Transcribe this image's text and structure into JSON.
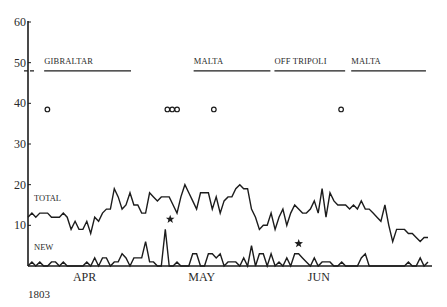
{
  "chart_data": {
    "type": "line",
    "title": "",
    "xlabel": "",
    "ylabel": "",
    "year_label": "1803",
    "ylim": [
      0,
      60
    ],
    "yticks": [
      10,
      20,
      30,
      40,
      50,
      60
    ],
    "grid": false,
    "months": [
      {
        "label": "APR",
        "x_frac": 0.14
      },
      {
        "label": "MAY",
        "x_frac": 0.43
      },
      {
        "label": "JUN",
        "x_frac": 0.72
      }
    ],
    "locations": [
      {
        "label": "GIBRALTAR",
        "start_frac": 0.04,
        "end_frac": 0.255,
        "y": 48
      },
      {
        "label": "MALTA",
        "start_frac": 0.41,
        "end_frac": 0.6,
        "y": 48
      },
      {
        "label": "OFF  TRIPOLI",
        "start_frac": 0.61,
        "end_frac": 0.785,
        "y": 48
      },
      {
        "label": "MALTA",
        "start_frac": 0.8,
        "end_frac": 0.985,
        "y": 48
      }
    ],
    "dashed_marker": {
      "y": 48
    },
    "circle_events": [
      {
        "x_frac": 0.048,
        "y": 38.5
      },
      {
        "x_frac": 0.345,
        "y": 38.5
      },
      {
        "x_frac": 0.357,
        "y": 38.5
      },
      {
        "x_frac": 0.369,
        "y": 38.5
      },
      {
        "x_frac": 0.46,
        "y": 38.5
      },
      {
        "x_frac": 0.775,
        "y": 38.5
      }
    ],
    "star_events": [
      {
        "x_frac": 0.352,
        "y": 11.5
      },
      {
        "x_frac": 0.67,
        "y": 5.5
      }
    ],
    "series": [
      {
        "name": "TOTAL",
        "label_y": 16,
        "values": [
          12,
          13,
          12,
          13,
          13,
          13,
          12,
          12,
          12,
          13,
          12,
          9,
          11,
          9,
          9,
          11,
          8,
          12,
          11,
          13,
          14,
          14,
          19,
          17,
          14,
          15,
          18,
          15,
          15,
          13,
          13,
          18,
          17,
          16,
          17,
          17,
          17,
          15,
          13,
          17,
          20,
          18,
          16,
          14,
          18,
          18,
          18,
          14,
          17,
          13,
          16,
          17,
          17,
          19,
          20,
          19,
          19,
          14,
          12,
          9,
          10,
          10,
          13,
          9,
          12,
          14,
          10,
          13,
          15,
          14,
          13,
          13,
          14,
          16,
          13,
          19,
          12,
          18,
          16,
          15,
          15,
          15,
          14,
          15,
          14,
          16,
          14,
          14,
          13,
          12,
          11,
          15,
          10,
          6,
          9,
          9,
          9,
          8,
          8,
          7,
          6,
          7,
          7
        ]
      },
      {
        "name": "NEW",
        "label_y": 4,
        "values": [
          0,
          1,
          0,
          1,
          0,
          0,
          1,
          1,
          0,
          1,
          0,
          0,
          0,
          0,
          0,
          1,
          0,
          2,
          0,
          2,
          2,
          0,
          1,
          1,
          3,
          2,
          0,
          2,
          2,
          2,
          6,
          1,
          1,
          0,
          0,
          9,
          0,
          0,
          1,
          0,
          0,
          0,
          3,
          3,
          0,
          0,
          3,
          3,
          2,
          3,
          0,
          1,
          1,
          1,
          0,
          2,
          0,
          5,
          0,
          3,
          3,
          0,
          3,
          0,
          1,
          0,
          2,
          0,
          3,
          3,
          2,
          1,
          0,
          2,
          0,
          1,
          1,
          1,
          0,
          0,
          1,
          0,
          0,
          0,
          0,
          2,
          3,
          0,
          0,
          0,
          0,
          0,
          0,
          0,
          0,
          0,
          0,
          1,
          0,
          0,
          2,
          0,
          1
        ]
      }
    ]
  }
}
